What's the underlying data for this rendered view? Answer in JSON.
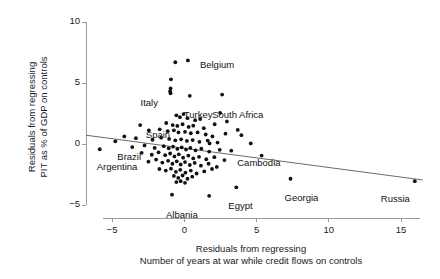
{
  "chart_data": {
    "type": "scatter",
    "title": "",
    "xlabel": "Residuals from regressing\nNumber of years at war while credit flows on controls",
    "xlabel_line1": "Residuals from regressing",
    "xlabel_line2": "Number of years at war while credit flows on controls",
    "ylabel": "Residuals from regressing\nPIT as % of GDP on controls",
    "ylabel_line1": "Residuals from regressing",
    "ylabel_line2": "PIT as % of GDP on controls",
    "xlim": [
      -6.8,
      17.0
    ],
    "ylim": [
      -5.8,
      10.0
    ],
    "xticks": [
      -5,
      0,
      5,
      10,
      15
    ],
    "xticklabels": [
      "−5",
      "0",
      "5",
      "10",
      "15"
    ],
    "yticks": [
      -5,
      0,
      5,
      10
    ],
    "yticklabels": [
      "−5",
      "0",
      "5",
      "10"
    ],
    "grid": false,
    "legend": "none",
    "marker_color": "#111111",
    "line_color": "#6b6b6b",
    "axis_color": "#9a9a9a",
    "trendline": {
      "x": [
        -6.8,
        16.5
      ],
      "y": [
        0.72,
        -2.95
      ]
    },
    "labeled_points": [
      {
        "label": "Belgium",
        "x": 0.25,
        "y": 6.85,
        "lx": 12,
        "ly": -1
      },
      {
        "label": "Italy",
        "x": -0.95,
        "y": 4.15,
        "lx": -30,
        "ly": 4
      },
      {
        "label": "Turkey",
        "x": 0.38,
        "y": 3.95,
        "lx": -6,
        "ly": 13
      },
      {
        "label": "South Africa",
        "x": 2.62,
        "y": 4.05,
        "lx": -10,
        "ly": 14
      },
      {
        "label": "Spain",
        "x": -2.45,
        "y": 1.12,
        "lx": -3,
        "ly": -1
      },
      {
        "label": "Brazil",
        "x": -4.77,
        "y": 0.22,
        "lx": 2,
        "ly": 10
      },
      {
        "label": "Argentina",
        "x": -5.85,
        "y": -0.43,
        "lx": -3,
        "ly": 12
      },
      {
        "label": "Cambodia",
        "x": 3.25,
        "y": -0.55,
        "lx": 6,
        "ly": 6
      },
      {
        "label": "Georgia",
        "x": 7.35,
        "y": -2.85,
        "lx": -6,
        "ly": 13
      },
      {
        "label": "Egypt",
        "x": 3.6,
        "y": -3.55,
        "lx": -8,
        "ly": 13
      },
      {
        "label": "Russia",
        "x": 15.95,
        "y": -3.05,
        "lx": -34,
        "ly": 12
      },
      {
        "label": "Albania",
        "x": -0.85,
        "y": -4.15,
        "lx": -6,
        "ly": 14
      }
    ],
    "points": [
      {
        "x": -5.85,
        "y": -0.43
      },
      {
        "x": -4.77,
        "y": 0.22
      },
      {
        "x": -2.45,
        "y": 1.12
      },
      {
        "x": 0.25,
        "y": 6.85
      },
      {
        "x": -0.62,
        "y": 6.7
      },
      {
        "x": -0.92,
        "y": 5.3
      },
      {
        "x": -0.95,
        "y": 4.55
      },
      {
        "x": -0.98,
        "y": 4.32
      },
      {
        "x": -0.95,
        "y": 4.15
      },
      {
        "x": 0.38,
        "y": 3.95
      },
      {
        "x": 2.62,
        "y": 4.05
      },
      {
        "x": -0.55,
        "y": 2.35
      },
      {
        "x": -0.3,
        "y": 2.2
      },
      {
        "x": -0.05,
        "y": 2.45
      },
      {
        "x": 0.22,
        "y": 2.12
      },
      {
        "x": 0.75,
        "y": 1.95
      },
      {
        "x": 1.1,
        "y": 2.05
      },
      {
        "x": -1.25,
        "y": 1.72
      },
      {
        "x": -0.8,
        "y": 1.55
      },
      {
        "x": -0.48,
        "y": 1.48
      },
      {
        "x": -0.12,
        "y": 1.62
      },
      {
        "x": 0.3,
        "y": 1.4
      },
      {
        "x": 0.62,
        "y": 1.5
      },
      {
        "x": 1.35,
        "y": 1.3
      },
      {
        "x": 2.1,
        "y": 1.62
      },
      {
        "x": -1.7,
        "y": 1.2
      },
      {
        "x": -1.15,
        "y": 1.05
      },
      {
        "x": -0.72,
        "y": 1.12
      },
      {
        "x": -0.4,
        "y": 0.95
      },
      {
        "x": 0.05,
        "y": 1.0
      },
      {
        "x": 0.45,
        "y": 0.88
      },
      {
        "x": 0.92,
        "y": 0.95
      },
      {
        "x": 1.48,
        "y": 0.78
      },
      {
        "x": 1.95,
        "y": 0.62
      },
      {
        "x": 2.85,
        "y": 0.85
      },
      {
        "x": 3.95,
        "y": 0.72
      },
      {
        "x": -3.35,
        "y": 0.48
      },
      {
        "x": -2.2,
        "y": 0.35
      },
      {
        "x": -1.6,
        "y": 0.52
      },
      {
        "x": -1.05,
        "y": 0.42
      },
      {
        "x": -0.62,
        "y": 0.3
      },
      {
        "x": -0.22,
        "y": 0.38
      },
      {
        "x": 0.18,
        "y": 0.25
      },
      {
        "x": 0.58,
        "y": 0.32
      },
      {
        "x": 1.05,
        "y": 0.18
      },
      {
        "x": 1.62,
        "y": 0.28
      },
      {
        "x": 2.3,
        "y": 0.12
      },
      {
        "x": 3.25,
        "y": -0.55
      },
      {
        "x": -3.6,
        "y": -0.25
      },
      {
        "x": -2.75,
        "y": -0.12
      },
      {
        "x": -2.05,
        "y": -0.32
      },
      {
        "x": -1.42,
        "y": -0.18
      },
      {
        "x": -1.08,
        "y": -0.35
      },
      {
        "x": -0.78,
        "y": -0.22
      },
      {
        "x": -0.48,
        "y": -0.4
      },
      {
        "x": -0.18,
        "y": -0.28
      },
      {
        "x": 0.12,
        "y": -0.45
      },
      {
        "x": 0.42,
        "y": -0.32
      },
      {
        "x": 0.78,
        "y": -0.52
      },
      {
        "x": 1.18,
        "y": -0.38
      },
      {
        "x": 1.72,
        "y": -0.62
      },
      {
        "x": 2.45,
        "y": -0.48
      },
      {
        "x": -2.95,
        "y": -0.72
      },
      {
        "x": -2.25,
        "y": -0.88
      },
      {
        "x": -1.78,
        "y": -0.68
      },
      {
        "x": -1.32,
        "y": -0.92
      },
      {
        "x": -0.98,
        "y": -0.78
      },
      {
        "x": -0.68,
        "y": -1.02
      },
      {
        "x": -0.38,
        "y": -0.85
      },
      {
        "x": -0.08,
        "y": -1.12
      },
      {
        "x": 0.28,
        "y": -0.95
      },
      {
        "x": 0.62,
        "y": -1.18
      },
      {
        "x": 1.02,
        "y": -1.05
      },
      {
        "x": 1.52,
        "y": -1.25
      },
      {
        "x": 2.08,
        "y": -1.08
      },
      {
        "x": 2.78,
        "y": -1.32
      },
      {
        "x": -2.48,
        "y": -1.45
      },
      {
        "x": -1.95,
        "y": -1.28
      },
      {
        "x": -1.52,
        "y": -1.52
      },
      {
        "x": -1.12,
        "y": -1.38
      },
      {
        "x": -0.82,
        "y": -1.62
      },
      {
        "x": -0.52,
        "y": -1.42
      },
      {
        "x": -0.25,
        "y": -1.68
      },
      {
        "x": 0.05,
        "y": -1.48
      },
      {
        "x": 0.38,
        "y": -1.72
      },
      {
        "x": 0.72,
        "y": -1.55
      },
      {
        "x": 1.15,
        "y": -1.78
      },
      {
        "x": 1.68,
        "y": -1.62
      },
      {
        "x": 2.25,
        "y": -1.88
      },
      {
        "x": -1.72,
        "y": -2.05
      },
      {
        "x": -1.28,
        "y": -2.18
      },
      {
        "x": -0.92,
        "y": -2.02
      },
      {
        "x": -0.58,
        "y": -2.28
      },
      {
        "x": -0.28,
        "y": -2.12
      },
      {
        "x": 0.08,
        "y": -2.35
      },
      {
        "x": 0.45,
        "y": -2.18
      },
      {
        "x": 0.85,
        "y": -2.42
      },
      {
        "x": 1.38,
        "y": -2.25
      },
      {
        "x": 1.92,
        "y": -2.05
      },
      {
        "x": -0.72,
        "y": -2.62
      },
      {
        "x": -0.42,
        "y": -2.78
      },
      {
        "x": -0.12,
        "y": -2.58
      },
      {
        "x": 0.22,
        "y": -2.85
      },
      {
        "x": 0.55,
        "y": -2.68
      },
      {
        "x": -0.25,
        "y": -3.05
      },
      {
        "x": 0.05,
        "y": -3.18
      },
      {
        "x": -0.55,
        "y": -3.12
      },
      {
        "x": 3.6,
        "y": -3.55
      },
      {
        "x": 7.35,
        "y": -2.85
      },
      {
        "x": 15.95,
        "y": -3.05
      },
      {
        "x": -0.85,
        "y": -4.15
      },
      {
        "x": 1.72,
        "y": -4.25
      },
      {
        "x": 5.35,
        "y": -0.95
      },
      {
        "x": 4.6,
        "y": 0.05
      },
      {
        "x": 2.95,
        "y": 1.85
      },
      {
        "x": 3.7,
        "y": 1.15
      },
      {
        "x": -3.05,
        "y": 1.55
      },
      {
        "x": -4.15,
        "y": 0.62
      },
      {
        "x": 2.48,
        "y": 2.55
      },
      {
        "x": 1.75,
        "y": 0.05
      }
    ]
  }
}
